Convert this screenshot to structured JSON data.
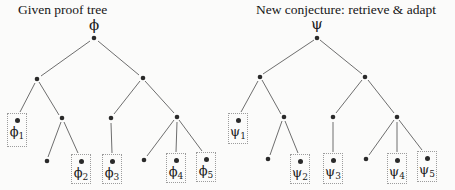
{
  "left_tree": {
    "title": "Given proof tree",
    "root_label": "ϕ",
    "leaves": [
      {
        "base": "ϕ",
        "sub": "1"
      },
      {
        "base": "ϕ",
        "sub": "2"
      },
      {
        "base": "ϕ",
        "sub": "3"
      },
      {
        "base": "ϕ",
        "sub": "4"
      },
      {
        "base": "ϕ",
        "sub": "5"
      }
    ]
  },
  "right_tree": {
    "title": "New conjecture: retrieve & adapt",
    "root_label": "ψ",
    "leaves": [
      {
        "base": "ψ",
        "sub": "1"
      },
      {
        "base": "ψ",
        "sub": "2"
      },
      {
        "base": "ψ",
        "sub": "3"
      },
      {
        "base": "ψ",
        "sub": "4"
      },
      {
        "base": "ψ",
        "sub": "5"
      }
    ]
  },
  "colors": {
    "background": "#fbfbfa",
    "edge": "#6e6e6e",
    "node_dot": "#2a2a2a",
    "box_border": "#9c9c9c",
    "text": "#1c1c1c"
  }
}
